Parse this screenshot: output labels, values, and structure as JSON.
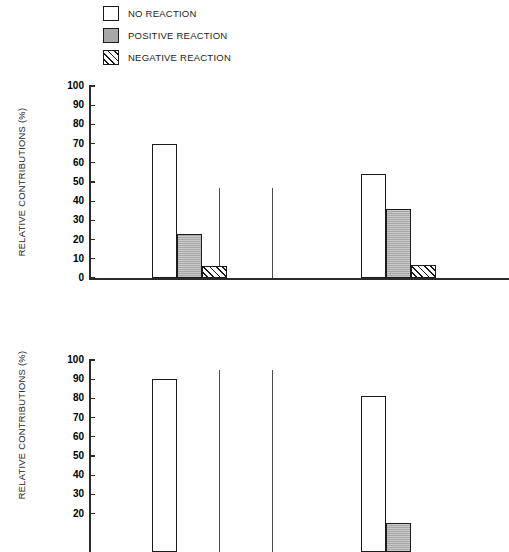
{
  "legend": {
    "items": [
      {
        "label": "NO REACTION",
        "key": "none",
        "swatch": "open-square"
      },
      {
        "label": "POSITIVE REACTION",
        "key": "pos",
        "swatch": "filled-gray-square"
      },
      {
        "label": "NEGATIVE REACTION",
        "key": "neg",
        "swatch": "hatched-square"
      }
    ]
  },
  "axis": {
    "ylabel": "RELATIVE CONTRIBUTIONS (%)",
    "ticks": [
      100,
      90,
      80,
      70,
      60,
      50,
      40,
      30,
      20,
      10,
      0
    ],
    "ymin": 0,
    "ymax": 100
  },
  "colors": {
    "no_reaction": "#ffffff",
    "positive_reaction": "#a9a9a9",
    "negative_reaction": "#ffffff",
    "outline": "#1a1a1a",
    "axis": "#2b2b2b"
  },
  "chart_data": [
    {
      "type": "bar",
      "title": "",
      "xlabel": "",
      "ylabel": "RELATIVE CONTRIBUTIONS (%)",
      "ylim": [
        0,
        100
      ],
      "yticks": [
        0,
        10,
        20,
        30,
        40,
        50,
        60,
        70,
        80,
        90,
        100
      ],
      "grid": false,
      "legend_position": "top",
      "categories": [
        "group-1",
        "group-2"
      ],
      "series": [
        {
          "name": "NO REACTION",
          "values": [
            70,
            54
          ]
        },
        {
          "name": "POSITIVE REACTION",
          "values": [
            23,
            36
          ]
        },
        {
          "name": "NEGATIVE REACTION",
          "values": [
            6,
            7
          ]
        }
      ]
    },
    {
      "type": "bar",
      "title": "",
      "xlabel": "",
      "ylabel": "RELATIVE CONTRIBUTIONS (%)",
      "ylim": [
        0,
        100
      ],
      "yticks": [
        0,
        10,
        20,
        30,
        40,
        50,
        60,
        70,
        80,
        90,
        100
      ],
      "grid": false,
      "legend_position": "top",
      "note": "panel is clipped by the bottom edge of the screenshot",
      "categories": [
        "group-1",
        "group-2"
      ],
      "series": [
        {
          "name": "NO REACTION",
          "values": [
            90,
            81
          ]
        },
        {
          "name": "POSITIVE REACTION",
          "values": [
            0,
            15
          ]
        },
        {
          "name": "NEGATIVE REACTION",
          "values": [
            0,
            0
          ]
        }
      ]
    }
  ]
}
